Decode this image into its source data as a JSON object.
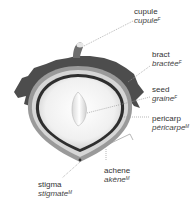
{
  "labels": [
    {
      "id": "cupule",
      "en": "cupule",
      "fr": "cupule",
      "gender": "F"
    },
    {
      "id": "bract",
      "en": "bract",
      "fr": "bractée",
      "gender": "F"
    },
    {
      "id": "seed",
      "en": "seed",
      "fr": "graine",
      "gender": "F"
    },
    {
      "id": "pericarp",
      "en": "pericarp",
      "fr": "péricarpe",
      "gender": "M"
    },
    {
      "id": "achene",
      "en": "achene",
      "fr": "akène",
      "gender": "M"
    },
    {
      "id": "stigma",
      "en": "stigma",
      "fr": "stigmate",
      "gender": "M"
    }
  ],
  "colors": {
    "bract": "#4a4a4a",
    "pericarp": "#8a8a8a",
    "interior": "#f4f4f4",
    "leader": "#9a9a9a"
  }
}
